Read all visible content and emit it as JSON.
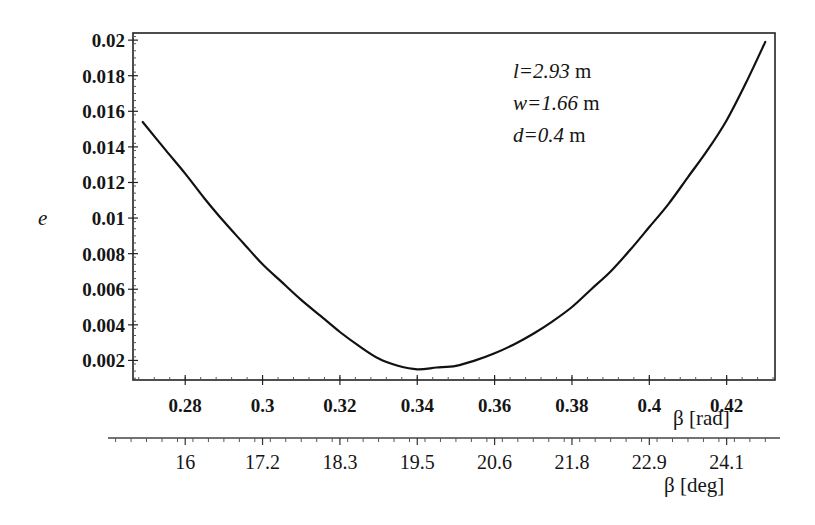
{
  "chart_data": {
    "type": "line",
    "title": "",
    "xlabel": "β [rad]",
    "ylabel": "e",
    "secondary_xlabel": "β [deg]",
    "xlim": [
      0.2665,
      0.4325
    ],
    "ylim": [
      0.0009,
      0.0204
    ],
    "grid": false,
    "legend": null,
    "y_ticks": [
      0.002,
      0.004,
      0.006,
      0.008,
      0.01,
      0.012,
      0.014,
      0.016,
      0.018,
      0.02
    ],
    "y_tick_labels": [
      "0.002",
      "0.004",
      "0.006",
      "0.008",
      "0.01",
      "0.012",
      "0.014",
      "0.016",
      "0.018",
      "0.02"
    ],
    "x_ticks": [
      0.28,
      0.3,
      0.32,
      0.34,
      0.36,
      0.38,
      0.4,
      0.42
    ],
    "x_tick_labels": [
      "0.28",
      "0.3",
      "0.32",
      "0.34",
      "0.36",
      "0.38",
      "0.4",
      "0.42"
    ],
    "secondary_x_ticks": [
      0.28,
      0.3,
      0.32,
      0.34,
      0.36,
      0.38,
      0.4,
      0.42
    ],
    "secondary_x_tick_labels": [
      "16",
      "17.2",
      "18.3",
      "19.5",
      "20.6",
      "21.8",
      "22.9",
      "24.1"
    ],
    "annotations": [
      {
        "var": "l",
        "value": "=2.93",
        "unit": " m"
      },
      {
        "var": "w",
        "value": "=1.66",
        "unit": " m"
      },
      {
        "var": "d",
        "value": "=0.4",
        "unit": " m"
      }
    ],
    "series": [
      {
        "name": "e(β)",
        "x": [
          0.269,
          0.275,
          0.28,
          0.285,
          0.29,
          0.295,
          0.3,
          0.305,
          0.31,
          0.315,
          0.32,
          0.325,
          0.33,
          0.335,
          0.34,
          0.345,
          0.35,
          0.355,
          0.36,
          0.365,
          0.37,
          0.375,
          0.38,
          0.385,
          0.39,
          0.395,
          0.4,
          0.405,
          0.41,
          0.415,
          0.42,
          0.425,
          0.43
        ],
        "values": [
          0.0154,
          0.0138,
          0.0125,
          0.0111,
          0.0098,
          0.0086,
          0.0074,
          0.0064,
          0.0054,
          0.0045,
          0.0036,
          0.0028,
          0.0021,
          0.0017,
          0.0015,
          0.0016,
          0.0017,
          0.002,
          0.0024,
          0.0029,
          0.0035,
          0.0042,
          0.005,
          0.006,
          0.007,
          0.0082,
          0.0095,
          0.0108,
          0.0123,
          0.0138,
          0.0155,
          0.0176,
          0.0199
        ]
      }
    ]
  },
  "labels": {
    "ylabel": "e",
    "xlabel_rad": "β [rad]",
    "xlabel_deg": "β [deg]",
    "annot_l_var": "l",
    "annot_l_val": "=2.93",
    "annot_l_unit": " m",
    "annot_w_var": "w",
    "annot_w_val": "=1.66",
    "annot_w_unit": " m",
    "annot_d_var": "d",
    "annot_d_val": "=0.4",
    "annot_d_unit": " m"
  },
  "colors": {
    "line": "#111111",
    "axis": "#222222",
    "background": "#ffffff"
  }
}
